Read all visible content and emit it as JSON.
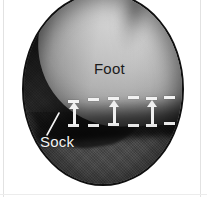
{
  "figure": {
    "type": "photographic-inset",
    "shape": "circle",
    "rendering": "grayscale"
  },
  "labels": {
    "foot": "Foot",
    "sock": "Sock"
  },
  "colors": {
    "page_background": "#ffffff",
    "circle_border": "#101010",
    "foot_light": "#d2d2d2",
    "foot_mid": "#bdbdbd",
    "sock_dark": "#2c2c2c",
    "ground_gray": "#4a4a4a",
    "annotation_white": "#f0f0f0",
    "foot_label_color": "#1b1b1b",
    "sock_label_color": "#f4f4f4"
  },
  "annotations": {
    "upper_dashes": [
      {
        "x": 68,
        "y": 100,
        "w": 11
      },
      {
        "x": 88,
        "y": 98,
        "w": 11
      },
      {
        "x": 108,
        "y": 97,
        "w": 11
      },
      {
        "x": 128,
        "y": 96,
        "w": 11
      },
      {
        "x": 146,
        "y": 97,
        "w": 11
      },
      {
        "x": 164,
        "y": 96,
        "w": 11
      }
    ],
    "lower_dashes": [
      {
        "x": 68,
        "y": 124,
        "w": 11
      },
      {
        "x": 88,
        "y": 124,
        "w": 11
      },
      {
        "x": 108,
        "y": 123,
        "w": 11
      },
      {
        "x": 128,
        "y": 124,
        "w": 11
      },
      {
        "x": 146,
        "y": 124,
        "w": 11
      },
      {
        "x": 164,
        "y": 122,
        "w": 11
      }
    ],
    "arrows": [
      {
        "x": 69,
        "y": 102,
        "h": 23,
        "direction": "up"
      },
      {
        "x": 109,
        "y": 100,
        "h": 24,
        "direction": "up"
      },
      {
        "x": 147,
        "y": 100,
        "h": 24,
        "direction": "up"
      }
    ],
    "leader_line": {
      "from_x": 5,
      "from_y": 25,
      "to_x": 17,
      "to_y": 3,
      "belongs_to": "Sock"
    }
  }
}
